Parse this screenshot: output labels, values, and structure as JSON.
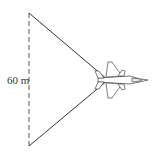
{
  "diagram": {
    "distance_label": "60 m",
    "line_color": "#333333",
    "figure": "airplane-icon"
  }
}
